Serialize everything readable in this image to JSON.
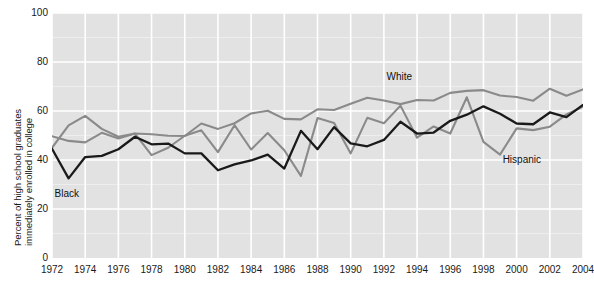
{
  "chart_data": {
    "type": "line",
    "title": "",
    "subtitle": "",
    "xlabel": "",
    "ylabel": "Percent of high school graduates immediately enrolled in college",
    "ylabel_line1": "Percent of high school graduates",
    "ylabel_line2": "immediately enrolled in college",
    "xlim": [
      1972,
      2004
    ],
    "ylim": [
      0,
      100
    ],
    "yticks": [
      0,
      20,
      40,
      60,
      80,
      100
    ],
    "xticks": [
      1972,
      1974,
      1976,
      1978,
      1980,
      1982,
      1984,
      1986,
      1988,
      1990,
      1992,
      1994,
      1996,
      1998,
      2000,
      2002,
      2004
    ],
    "grid": true,
    "grid_color": "#ffffff",
    "plot_background": "#e2e2e2",
    "legend_position": "inline-annotations",
    "x": [
      1972,
      1973,
      1974,
      1975,
      1976,
      1977,
      1978,
      1979,
      1980,
      1981,
      1982,
      1983,
      1984,
      1985,
      1986,
      1987,
      1988,
      1989,
      1990,
      1991,
      1992,
      1993,
      1994,
      1995,
      1996,
      1997,
      1998,
      1999,
      2000,
      2001,
      2002,
      2003,
      2004
    ],
    "series": [
      {
        "name": "White",
        "color": "#8a8a8a",
        "label_x": 1993,
        "label_y": 74,
        "values": [
          49.7,
          47.8,
          47.2,
          51.1,
          48.8,
          50.8,
          50.5,
          49.9,
          49.8,
          54.9,
          52.7,
          55.0,
          59.0,
          60.1,
          56.8,
          56.6,
          60.7,
          60.4,
          63.0,
          65.4,
          64.3,
          62.8,
          64.5,
          64.3,
          67.4,
          68.2,
          68.5,
          66.3,
          65.7,
          64.2,
          69.1,
          66.2,
          68.8
        ]
      },
      {
        "name": "Black",
        "color": "#1a1a1a",
        "label_x": 1973,
        "label_y": 26,
        "values": [
          44.6,
          32.5,
          41.2,
          41.7,
          44.4,
          49.5,
          46.4,
          46.7,
          42.7,
          42.7,
          35.8,
          38.2,
          39.8,
          42.2,
          36.5,
          51.9,
          44.4,
          53.4,
          46.8,
          45.6,
          48.2,
          55.6,
          50.8,
          51.2,
          56.0,
          58.5,
          61.9,
          58.9,
          54.9,
          54.6,
          59.4,
          57.5,
          62.5
        ]
      },
      {
        "name": "Hispanic",
        "color": "#8a8a8a",
        "label_x": 2000,
        "label_y": 40,
        "values": [
          45.0,
          54.1,
          58.0,
          52.7,
          49.5,
          50.8,
          42.0,
          45.0,
          49.9,
          52.1,
          43.2,
          54.2,
          44.3,
          51.0,
          44.0,
          33.5,
          57.1,
          55.1,
          42.7,
          57.2,
          55.0,
          62.2,
          49.1,
          53.7,
          50.8,
          65.6,
          47.4,
          42.2,
          52.9,
          52.2,
          53.6,
          58.6,
          61.8
        ]
      }
    ]
  }
}
